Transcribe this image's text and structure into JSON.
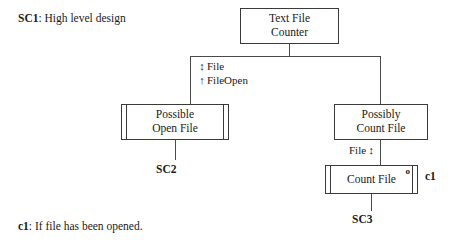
{
  "diagram": {
    "title_note": {
      "id": "SC1",
      "sep": ": ",
      "text": "High level design"
    },
    "footnote": {
      "id": "c1",
      "sep": ": ",
      "text": "If file has been opened."
    },
    "boxes": {
      "root": {
        "line1": "Text File",
        "line2": "Counter"
      },
      "left_child": {
        "line1": "Possible",
        "line2": "Open File"
      },
      "right_child": {
        "line1": "Possibly",
        "line2": "Count File"
      },
      "count_file": {
        "line1": "Count File",
        "marker": "o"
      }
    },
    "flows": {
      "left_branch": [
        {
          "arrow": "↕",
          "label": "File"
        },
        {
          "arrow": "↑",
          "label": "FileOpen"
        }
      ],
      "right_branch": {
        "label": "File",
        "arrow": "↕"
      }
    },
    "tags": {
      "sc2": "SC2",
      "sc3": "SC3",
      "c1": "c1"
    }
  }
}
